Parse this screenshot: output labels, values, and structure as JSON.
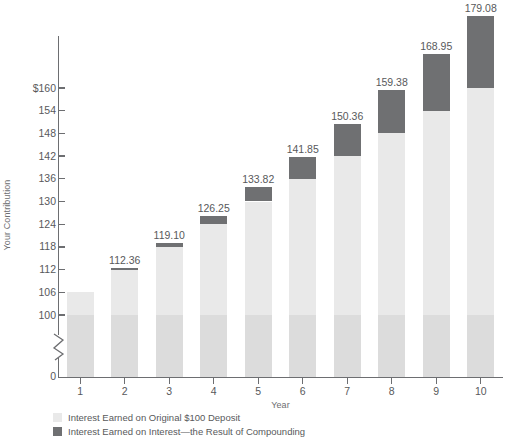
{
  "chart_data": {
    "type": "bar",
    "title": "",
    "subtitle": "",
    "xlabel": "Year",
    "ylabel": "Your Contribution",
    "categories": [
      "1",
      "2",
      "3",
      "4",
      "5",
      "6",
      "7",
      "8",
      "9",
      "10"
    ],
    "x": [
      1,
      2,
      3,
      4,
      5,
      6,
      7,
      8,
      9,
      10
    ],
    "ylim": [
      100,
      160
    ],
    "y_axis_has_break": true,
    "y_break_between": [
      0,
      100
    ],
    "yticks": [
      100,
      106,
      112,
      118,
      124,
      130,
      136,
      142,
      148,
      154,
      160
    ],
    "ytick_labels": [
      "100",
      "106",
      "112",
      "118",
      "124",
      "130",
      "136",
      "142",
      "148",
      "154",
      "$160"
    ],
    "ytick_zero_label": "0",
    "grid": false,
    "stacked": true,
    "legend_position": "bottom-left",
    "series": [
      {
        "name": "Interest Earned on Original $100 Deposit",
        "color": "#e9e9e9",
        "values": [
          106.0,
          112.0,
          118.0,
          124.0,
          130.0,
          136.0,
          142.0,
          148.0,
          154.0,
          160.0
        ]
      },
      {
        "name": "Interest Earned on Interest—the Result of Compounding",
        "color": "#6f7072",
        "values": [
          0.0,
          0.36,
          1.1,
          2.25,
          3.82,
          5.85,
          8.36,
          11.38,
          14.95,
          19.08
        ]
      }
    ],
    "totals": [
      106.0,
      112.36,
      119.1,
      126.25,
      133.82,
      141.85,
      150.36,
      159.38,
      168.95,
      179.08
    ],
    "data_labels": [
      "106.00",
      "112.36",
      "119.10",
      "126.25",
      "133.82",
      "141.85",
      "150.36",
      "159.38",
      "168.95",
      "179.08"
    ],
    "data_labels_shown": [
      false,
      true,
      true,
      true,
      true,
      true,
      true,
      true,
      true,
      true
    ],
    "principal_band": {
      "label": "$100 principal",
      "value": 100,
      "color": "#dcdcdc"
    },
    "annotations": []
  },
  "legend": {
    "items": [
      {
        "label": "Interest Earned on Original $100 Deposit",
        "color": "#e9e9e9"
      },
      {
        "label": "Interest Earned on Interest—the Result of Compounding",
        "color": "#6f7072"
      }
    ]
  },
  "axes": {
    "y_title": "Your Contribution",
    "x_title": "Year"
  },
  "colors": {
    "axis": "#6d6e71",
    "text": "#58595b",
    "principal": "#dcdcdc",
    "simple_interest": "#e9e9e9",
    "compound_interest": "#6f7072",
    "background": "#ffffff"
  }
}
